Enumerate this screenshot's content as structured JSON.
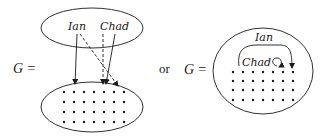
{
  "left_diagram": {
    "equation_label": "G =",
    "top_set": {
      "labels": [
        "Ian",
        "Chad"
      ]
    },
    "bottom_set": {
      "dot_grid": {
        "rows": 4,
        "cols": 7
      }
    },
    "edges": [
      {
        "from": "Ian",
        "style": "solid"
      },
      {
        "from": "Ian",
        "style": "dashed"
      },
      {
        "from": "Chad",
        "style": "dashed"
      },
      {
        "from": "Chad",
        "style": "solid"
      }
    ]
  },
  "connector": "or",
  "right_diagram": {
    "equation_label": "G =",
    "labels": [
      "Ian",
      "Chad"
    ],
    "dot_grid": {
      "rows": 4,
      "cols": 7
    }
  },
  "colors": {
    "ink": "#1a1a1a",
    "background": "#ffffff"
  }
}
